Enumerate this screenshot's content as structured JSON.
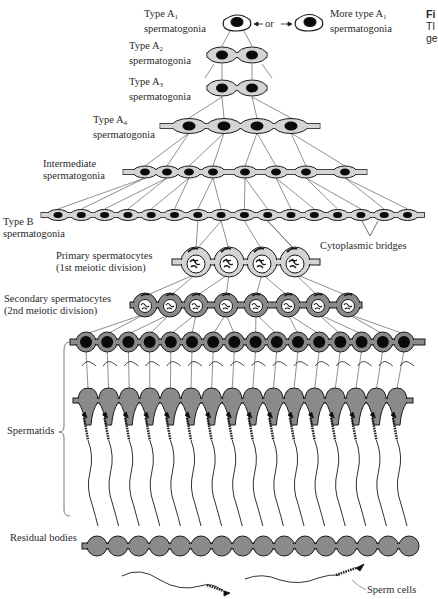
{
  "figure": {
    "caption_head": "Fi",
    "caption_line2": "Tl",
    "caption_line3": "ge"
  },
  "labels": {
    "typeA1": {
      "line1": "Type A",
      "sub": "1",
      "line2": "spermatogonia"
    },
    "or": "or",
    "moreA1": {
      "line1": "More type A",
      "sub": "1",
      "line2": "spermatogonia"
    },
    "typeA2": {
      "line1": "Type A",
      "sub": "2",
      "line2": "spermatogonia"
    },
    "typeA3": {
      "line1": "Type A",
      "sub": "3",
      "line2": "spermatogonia"
    },
    "typeA4": {
      "line1": "Type A",
      "sub": "4",
      "line2": "spermatogonia"
    },
    "intermediate": {
      "line1": "Intermediate",
      "line2": "spermatogonia"
    },
    "typeB": {
      "line1": "Type B",
      "line2": "spermatogonia"
    },
    "bridges": "Cytoplasmic bridges",
    "primary": {
      "line1": "Primary spermatocytes",
      "line2": "(1st meiotic division)"
    },
    "secondary": {
      "line1": "Secondary spermatocytes",
      "line2": "(2nd meiotic division)"
    },
    "spermatids": "Spermatids",
    "residual": "Residual bodies",
    "sperm": "Sperm cells"
  },
  "colors": {
    "cell_fill": "#d4d4d4",
    "dark_fill": "#8a8a8a",
    "nucleus": "#0a0a0a",
    "stroke": "#1a1a1a"
  },
  "stages": [
    {
      "name": "Type A1",
      "cells": 1
    },
    {
      "name": "Type A2",
      "cells": 2
    },
    {
      "name": "Type A3",
      "cells": 2
    },
    {
      "name": "Type A4",
      "cells": 4
    },
    {
      "name": "Intermediate",
      "cells": 8
    },
    {
      "name": "Type B",
      "cells": 16
    },
    {
      "name": "Primary spermatocytes",
      "cells": 4
    },
    {
      "name": "Secondary spermatocytes",
      "cells": 8
    },
    {
      "name": "Spermatids",
      "cells": 16
    },
    {
      "name": "Residual bodies",
      "cells": 16
    }
  ]
}
